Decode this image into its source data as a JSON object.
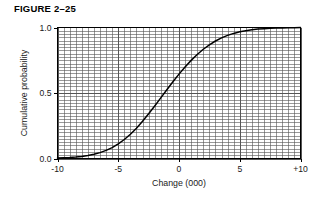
{
  "figure": {
    "title": "FIGURE 2–25"
  },
  "chart_data": {
    "type": "line",
    "title": "",
    "subtitle": "",
    "xlabel": "Change (000)",
    "ylabel": "Cumulative probability",
    "xlim": [
      -10,
      10
    ],
    "ylim": [
      0.0,
      1.0
    ],
    "grid": "on",
    "grid_minor_x_step": 0.5,
    "grid_minor_y_step": 0.025,
    "grid_major_x_step": 5,
    "grid_major_y_step": 0.5,
    "legend": "none",
    "xticks": [
      -10,
      -5,
      0,
      5,
      10
    ],
    "xtick_labels": [
      "-10",
      "-5",
      "0",
      "5",
      "+10"
    ],
    "yticks": [
      0.0,
      0.5,
      1.0
    ],
    "ytick_labels": [
      "0.0",
      "0.5",
      "1.0"
    ],
    "line_color": "#000000",
    "grid_color": "#555555",
    "frame_color": "#000000",
    "series": [
      {
        "name": "Cumulative probability",
        "x": [
          -10.0,
          -9.5,
          -9.0,
          -8.5,
          -8.0,
          -7.5,
          -7.0,
          -6.5,
          -6.0,
          -5.5,
          -5.0,
          -4.5,
          -4.0,
          -3.5,
          -3.0,
          -2.5,
          -2.0,
          -1.5,
          -1.0,
          -0.5,
          0.0,
          0.5,
          1.0,
          1.5,
          2.0,
          2.5,
          3.0,
          3.5,
          4.0,
          4.5,
          5.0,
          5.5,
          6.0,
          6.5,
          7.0,
          7.5,
          8.0,
          8.5,
          9.0,
          9.5,
          10.0
        ],
        "values": [
          0.003,
          0.005,
          0.007,
          0.011,
          0.016,
          0.023,
          0.032,
          0.045,
          0.062,
          0.083,
          0.111,
          0.145,
          0.185,
          0.231,
          0.284,
          0.341,
          0.401,
          0.463,
          0.525,
          0.586,
          0.644,
          0.699,
          0.749,
          0.794,
          0.834,
          0.868,
          0.897,
          0.921,
          0.94,
          0.955,
          0.967,
          0.976,
          0.983,
          0.988,
          0.991,
          0.994,
          0.996,
          0.997,
          0.998,
          0.999,
          1.0
        ]
      }
    ]
  }
}
